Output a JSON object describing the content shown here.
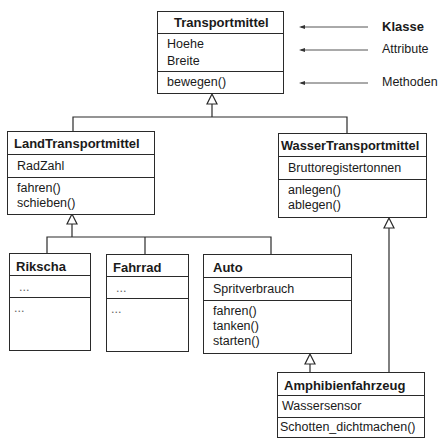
{
  "legend": {
    "klasse": "Klasse",
    "attribute": "Attribute",
    "methoden": "Methoden"
  },
  "classes": {
    "transportmittel": {
      "name": "Transportmittel",
      "attributes": [
        "Hoehe",
        "Breite"
      ],
      "methods": [
        "bewegen()"
      ]
    },
    "land": {
      "name": "LandTransportmittel",
      "attributes": [
        "RadZahl"
      ],
      "methods": [
        "fahren()",
        "schieben()"
      ]
    },
    "wasser": {
      "name": "WasserTransportmittel",
      "attributes": [
        "Bruttoregistertonnen"
      ],
      "methods": [
        "anlegen()",
        "ablegen()"
      ]
    },
    "rikscha": {
      "name": "Rikscha",
      "attributes": [
        "..."
      ],
      "methods": [
        "..."
      ]
    },
    "fahrrad": {
      "name": "Fahrrad",
      "attributes": [
        "..."
      ],
      "methods": [
        "..."
      ]
    },
    "auto": {
      "name": "Auto",
      "attributes": [
        "Spritverbrauch"
      ],
      "methods": [
        "fahren()",
        "tanken()",
        "starten()"
      ]
    },
    "amphibien": {
      "name": "Amphibienfahrzeug",
      "attributes": [
        "Wassersensor"
      ],
      "methods": [
        "Schotten_dichtmachen()"
      ]
    }
  },
  "colors": {
    "line": "#2a2a2a",
    "text": "#1a1a1a",
    "background": "#ffffff"
  }
}
